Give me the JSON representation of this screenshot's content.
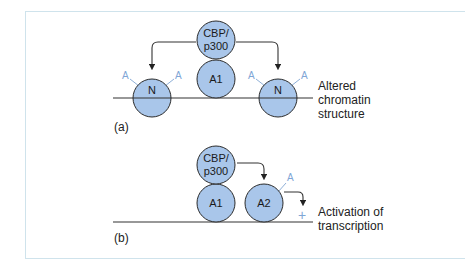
{
  "colors": {
    "node_fill": "#a9c6ea",
    "node_stroke": "#2b2b2b",
    "acetyl": "#7fa6d6",
    "frame": "#cfe3ec",
    "line": "#333333"
  },
  "panel_a": {
    "label": "(a)",
    "nodes": {
      "cbp": [
        "CBP/",
        "p300"
      ],
      "activator": "A1",
      "nucleosome_left": "N",
      "nucleosome_right": "N"
    },
    "acetyl_mark": "A",
    "outcome": [
      "Altered",
      "chromatin",
      "structure"
    ]
  },
  "panel_b": {
    "label": "(b)",
    "nodes": {
      "cbp": [
        "CBP/",
        "p300"
      ],
      "activator1": "A1",
      "activator2": "A2"
    },
    "acetyl_mark": "A",
    "plus": "+",
    "outcome": [
      "Activation of",
      "transcription"
    ]
  }
}
